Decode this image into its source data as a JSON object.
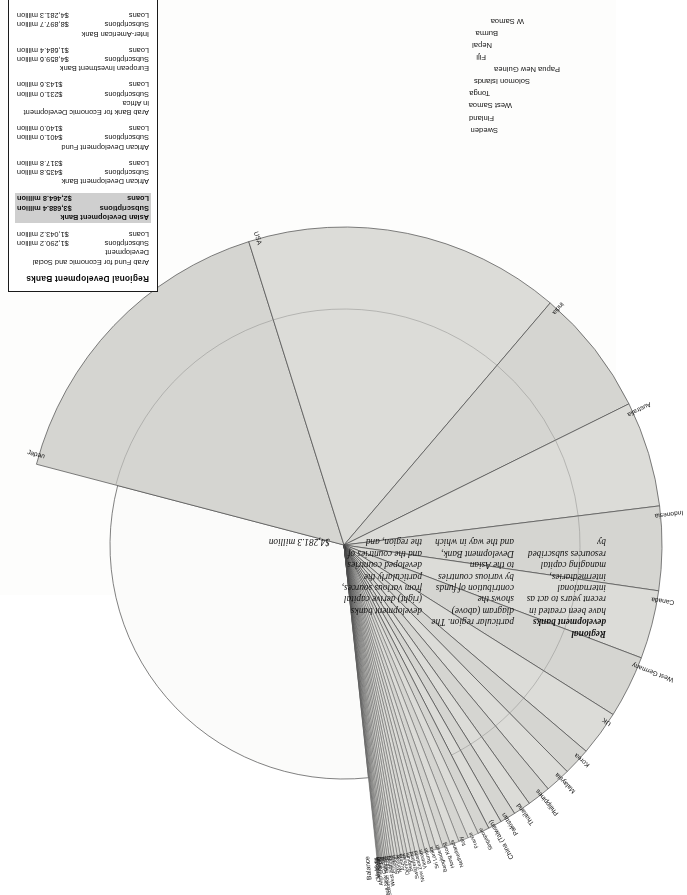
{
  "body_text": {
    "col1": {
      "heading": "Regional development banks",
      "text": "have been created in recent years to act as international intermediaries, managing capital resources subscribed by"
    },
    "col2": {
      "text": "particular region. The diagram (above) shows the contribution of funds by various countries to the Asian Development Bank, and the way in which"
    },
    "col3": {
      "text": "development banks (right) derive capital from various sources, particularly the developed countries and the countries of the region, and"
    },
    "col4": {
      "text": "$4,281.3 million"
    }
  },
  "legend": {
    "title": "Regional Development Banks",
    "banks": [
      {
        "name": "Arab Fund for Economic and Social Development",
        "subscriptions_label": "Subscriptions",
        "subscriptions_value": "$1,290.2 million",
        "loans_label": "Loans",
        "loans_value": "$1,043.2 million",
        "highlight": false
      },
      {
        "name": "Asian Development Bank",
        "subscriptions_label": "Subscriptions",
        "subscriptions_value": "$3,688.4 million",
        "loans_label": "Loans",
        "loans_value": "$2,464.8 million",
        "highlight": true
      },
      {
        "name": "African Development Bank",
        "subscriptions_label": "Subscriptions",
        "subscriptions_value": "$435.8 million",
        "loans_label": "Loans",
        "loans_value": "$317.8 million",
        "highlight": false
      },
      {
        "name": "African Development Fund",
        "subscriptions_label": "Subscriptions",
        "subscriptions_value": "$401.0 million",
        "loans_label": "Loans",
        "loans_value": "$140.0 million",
        "highlight": false
      },
      {
        "name": "Arab Bank for Economic Development in Africa",
        "subscriptions_label": "Subscriptions",
        "subscriptions_value": "$231.0 million",
        "loans_label": "Loans",
        "loans_value": "$143.6 million",
        "highlight": false
      },
      {
        "name": "European Investment Bank",
        "subscriptions_label": "Subscriptions",
        "subscriptions_value": "$4,859.6 million",
        "loans_label": "Loans",
        "loans_value": "$1,684.4 million",
        "highlight": false
      },
      {
        "name": "Inter-American Bank",
        "subscriptions_label": "Subscriptions",
        "subscriptions_value": "$8,897.7 million",
        "loans_label": "Loans",
        "loans_value": "$4,281.3 million",
        "highlight": false
      }
    ]
  },
  "chart_data": {
    "type": "pie",
    "legend_position": "outside-left",
    "grid": false,
    "units": "share of total subscriptions",
    "categories": [
      "Balance",
      "Japan",
      "USA",
      "India",
      "Australia",
      "Indonesia",
      "Canada",
      "West Germany",
      "UK",
      "Korea",
      "Malaysia",
      "Philippines",
      "Thailand",
      "Pakistan",
      "China (Taiwan)",
      "Singapore",
      "France",
      "Italy",
      "Netherlands",
      "Hong Kong",
      "Bangladesh",
      "Sri Lanka",
      "Burma",
      "Vietnam",
      "New Zealand",
      "Switzerland",
      "Belgium",
      "Denmark",
      "Austria",
      "Norway",
      "Sweden",
      "Finland",
      "West Samoa",
      "Tonga",
      "Solomon Islands",
      "Papua New Guinea",
      "Fiji",
      "Nepal",
      "Afghanistan",
      "Laos",
      "Cambodia",
      "Maldives"
    ],
    "values": [
      31.0,
      16.2,
      16.2,
      6.5,
      5.4,
      4.3,
      3.5,
      3.2,
      2.3,
      1.4,
      1.3,
      1.2,
      0.9,
      0.8,
      0.7,
      0.6,
      0.55,
      0.5,
      0.45,
      0.4,
      0.35,
      0.3,
      0.28,
      0.26,
      0.24,
      0.22,
      0.2,
      0.18,
      0.17,
      0.16,
      0.15,
      0.14,
      0.12,
      0.11,
      0.1,
      0.09,
      0.08,
      0.07,
      0.06,
      0.05,
      0.04,
      0.03
    ],
    "outer_labels": [
      "Sweden",
      "Finland",
      "West Samoa",
      "Tonga",
      "Solomon Islands",
      "Papua New Guinea",
      "Fiji",
      "Nepal",
      "Burma",
      "W Samoa"
    ]
  }
}
